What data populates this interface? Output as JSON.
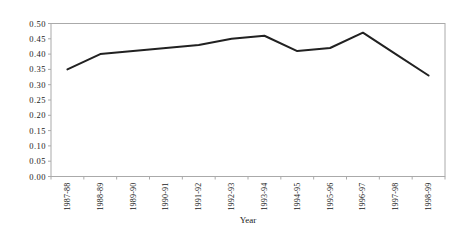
{
  "chart_data": {
    "type": "line",
    "title": "",
    "xlabel": "Year",
    "ylabel": "",
    "categories": [
      "1987-88",
      "1988-89",
      "1989-90",
      "1990-91",
      "1991-92",
      "1992-93",
      "1993-94",
      "1994-95",
      "1995-96",
      "1996-97",
      "1997-98",
      "1998-99"
    ],
    "series": [
      {
        "name": "series-1",
        "values": [
          0.35,
          0.4,
          0.41,
          0.42,
          0.43,
          0.45,
          0.46,
          0.41,
          0.42,
          0.47,
          0.4,
          0.33
        ]
      }
    ],
    "ylim": [
      0.0,
      0.5
    ],
    "ytick_step": 0.05,
    "ytick_labels": [
      "0.00",
      "0.05",
      "0.10",
      "0.15",
      "0.20",
      "0.25",
      "0.30",
      "0.35",
      "0.40",
      "0.45",
      "0.50"
    ],
    "grid": "off",
    "legend": "none",
    "x_labels_rotation_deg": -90,
    "colors": {
      "line": "#212121",
      "frame": "#aaaaaa",
      "tick": "#aaaaaa",
      "text": "#1a1a1a",
      "background": "#ffffff"
    }
  }
}
